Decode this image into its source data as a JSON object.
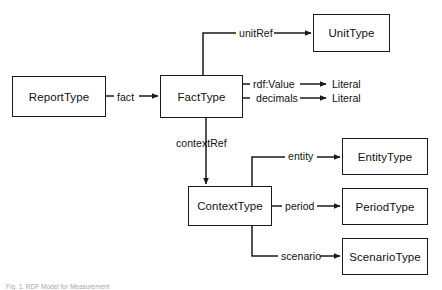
{
  "figure": {
    "caption": "Fig. 1. RDF Model for Measurement",
    "background_color": "#ffffff",
    "stroke_color": "#1a1a1a",
    "text_color": "#111111"
  },
  "nodes": [
    {
      "id": "report-type",
      "label": "ReportType",
      "x": 12,
      "y": 76,
      "w": 94,
      "h": 41
    },
    {
      "id": "fact-type",
      "label": "FactType",
      "x": 160,
      "y": 75,
      "w": 83,
      "h": 43
    },
    {
      "id": "unit-type",
      "label": "UnitType",
      "x": 313,
      "y": 14,
      "w": 77,
      "h": 38
    },
    {
      "id": "context-type",
      "label": "ContextType",
      "x": 188,
      "y": 186,
      "w": 84,
      "h": 40
    },
    {
      "id": "entity-type",
      "label": "EntityType",
      "x": 342,
      "y": 138,
      "w": 86,
      "h": 37
    },
    {
      "id": "period-type",
      "label": "PeriodType",
      "x": 342,
      "y": 188,
      "w": 86,
      "h": 37
    },
    {
      "id": "scenario-type",
      "label": "ScenarioType",
      "x": 342,
      "y": 238,
      "w": 86,
      "h": 37
    }
  ],
  "edge_labels": [
    {
      "id": "fact",
      "label": "fact",
      "x": 117,
      "y": 91
    },
    {
      "id": "unitref",
      "label": "unitRef",
      "x": 239,
      "y": 27
    },
    {
      "id": "contextref",
      "label": "contextRef",
      "x": 176,
      "y": 137
    },
    {
      "id": "entity",
      "label": "entity",
      "x": 288,
      "y": 150
    },
    {
      "id": "period",
      "label": "period",
      "x": 285,
      "y": 200
    },
    {
      "id": "scenario",
      "label": "scenario",
      "x": 281,
      "y": 250
    },
    {
      "id": "rdf-value",
      "label": "rdf:Value",
      "x": 253,
      "y": 84
    },
    {
      "id": "decimals",
      "label": "decimals",
      "x": 256,
      "y": 98
    }
  ],
  "plain_targets": [
    {
      "id": "literal-value",
      "label": "Literal",
      "x": 332,
      "y": 84
    },
    {
      "id": "literal-decimals",
      "label": "Literal",
      "x": 332,
      "y": 98
    }
  ]
}
